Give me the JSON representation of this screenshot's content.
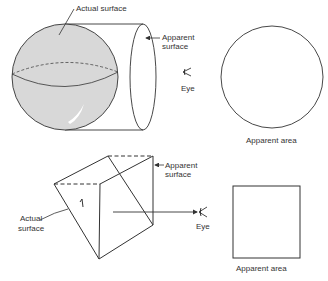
{
  "top": {
    "actual_surface_label": "Actual surface",
    "apparent_surface_label_1": "Apparent",
    "apparent_surface_label_2": "surface",
    "eye_label": "Eye",
    "apparent_area_label": "Apparent area"
  },
  "bottom": {
    "actual_surface_label_1": "Actual",
    "actual_surface_label_2": "surface",
    "apparent_surface_label_1": "Apparent",
    "apparent_surface_label_2": "surface",
    "eye_label": "Eye",
    "apparent_area_label": "Apparent area"
  },
  "colors": {
    "line": "#333333",
    "sphere_fill": "#d8d8d8"
  }
}
